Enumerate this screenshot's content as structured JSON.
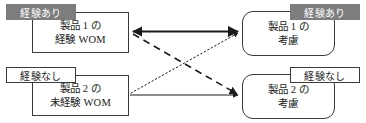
{
  "diagram": {
    "colors": {
      "tag_filled_bg": "#7d7d7d",
      "tag_filled_text": "#ffffff",
      "tag_outlined_bg": "#ffffff",
      "box_border": "#3a3a3a",
      "text": "#1a1a1a",
      "connector": "#1a1a1a",
      "background": "#ffffff"
    },
    "nodes": [
      {
        "id": "p1-wom",
        "role": "source",
        "shape": "rectangle",
        "line1": "製品 1 の",
        "line2": "経験 WOM"
      },
      {
        "id": "p2-wom",
        "role": "source",
        "shape": "rectangle",
        "line1": "製品 2 の",
        "line2": "未経験 WOM"
      },
      {
        "id": "p1-con",
        "role": "target",
        "shape": "rounded-rectangle",
        "line1": "製品 1 の",
        "line2": "考慮"
      },
      {
        "id": "p2-con",
        "role": "target",
        "shape": "rounded-rectangle",
        "line1": "製品 2 の",
        "line2": "考慮"
      }
    ],
    "tags": [
      {
        "id": "top-left",
        "label": "経験あり",
        "style": "filled"
      },
      {
        "id": "top-right",
        "label": "経験あり",
        "style": "filled"
      },
      {
        "id": "bottom-left",
        "label": "経験なし",
        "style": "outlined"
      },
      {
        "id": "bottom-right",
        "label": "経験なし",
        "style": "outlined"
      }
    ],
    "connectors": [
      {
        "id": "p1wom-to-p1con",
        "from": "p1-wom",
        "to": "p1-con",
        "line_style": "solid",
        "weight": "thick",
        "arrowheads": "both"
      },
      {
        "id": "p2wom-to-p2con",
        "from": "p2-wom",
        "to": "p2-con",
        "line_style": "solid",
        "weight": "thin",
        "arrowheads": "end"
      },
      {
        "id": "p1wom-to-p2con",
        "from": "p1-wom",
        "to": "p2-con",
        "line_style": "dashed",
        "weight": "medium",
        "arrowheads": "end"
      },
      {
        "id": "p2wom-to-p1con",
        "from": "p2-wom",
        "to": "p1-con",
        "line_style": "dotted",
        "weight": "thin",
        "arrowheads": "end"
      }
    ]
  }
}
